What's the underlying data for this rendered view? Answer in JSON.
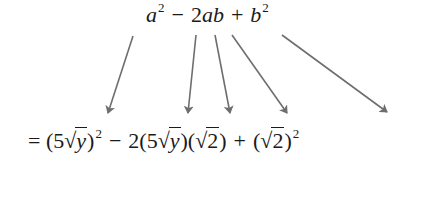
{
  "diagram": {
    "top_expression": {
      "a": "a",
      "a_exp": "2",
      "minus": "−",
      "two": "2",
      "a2": "a",
      "b": "b",
      "plus": "+",
      "b2": "b",
      "b_exp": "2"
    },
    "bottom_expression": {
      "equals": "=",
      "term1_open": "(5",
      "radical": "√",
      "y": "y",
      "term1_close": ")",
      "term1_exp": "2",
      "minus": "−",
      "term2_prefix": "2(5",
      "y2": "y",
      "term2_mid": ")(",
      "two_a": "2",
      "term2_close": ")",
      "plus": "+",
      "term3_open": "(",
      "two_b": "2",
      "term3_close": ")",
      "term3_exp": "2"
    },
    "arrows": [
      {
        "from": "a",
        "to": "5√y",
        "x1": 133,
        "y1": 36,
        "x2": 108,
        "y2": 113
      },
      {
        "from": "2",
        "to": "2",
        "x1": 196,
        "y1": 35,
        "x2": 188,
        "y2": 113
      },
      {
        "from": "a",
        "to": "5√y",
        "x1": 215,
        "y1": 35,
        "x2": 230,
        "y2": 113
      },
      {
        "from": "b",
        "to": "√2",
        "x1": 232,
        "y1": 35,
        "x2": 287,
        "y2": 113
      },
      {
        "from": "b",
        "to": "√2",
        "x1": 282,
        "y1": 35,
        "x2": 387,
        "y2": 112
      }
    ],
    "arrow_color": "#6e6e6e",
    "text_color": "#1a1a1a"
  }
}
